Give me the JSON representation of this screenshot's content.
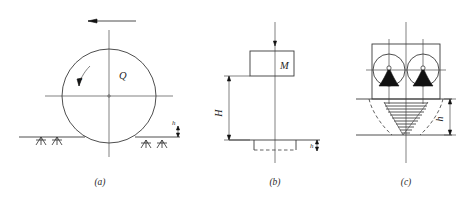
{
  "figure": {
    "title": "",
    "background_color": "#ffffff",
    "line_color": "#3a3a3a",
    "fill_color": "#111111",
    "panels": [
      {
        "id": "a",
        "caption": "(a)",
        "description": "wheel-on-ground load diagram",
        "labels": {
          "radius": "r",
          "load": "Q",
          "depth": "h"
        },
        "elements": [
          "travel-direction-arrow",
          "wheel-circle",
          "vertical-axis",
          "horizontal-axis",
          "ground-line",
          "ground-hatching",
          "radius-arc"
        ]
      },
      {
        "id": "b",
        "caption": "(b)",
        "description": "mass on shaft elevation diagram",
        "labels": {
          "mass": "M",
          "height": "H",
          "depth": "h"
        },
        "elements": [
          "mass-box",
          "vertical-shaft",
          "height-dimension",
          "ground-line",
          "foundation-dashed-base",
          "depth-dimension"
        ]
      },
      {
        "id": "c",
        "caption": "(c)",
        "description": "twin wheel pressure bulb diagram",
        "labels": {
          "depth": "h"
        },
        "elements": [
          "twin-wheel-frame",
          "left-wheel",
          "right-wheel",
          "left-cone-fill",
          "right-cone-fill",
          "ground-line",
          "pressure-bulb-dashed",
          "hatched-stress-cone",
          "depth-dimension"
        ]
      }
    ]
  },
  "captions": {
    "a": "(a)",
    "b": "(b)",
    "c": "(c)"
  },
  "labels": {
    "radius_r": "r",
    "load_Q": "Q",
    "mass_M": "M",
    "height_H": "H",
    "depth_h_a": "h",
    "depth_h_b": "h",
    "depth_h_c": "h"
  }
}
